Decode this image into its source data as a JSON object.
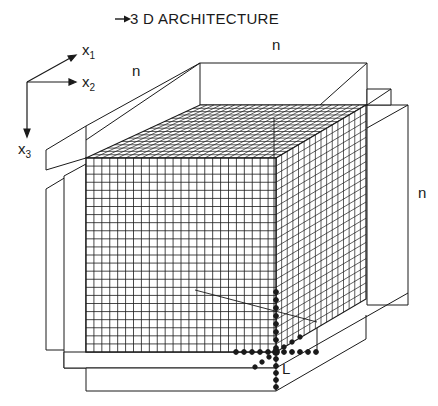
{
  "title": "3 D ARCHITECTURE",
  "title_arrow": "right-arrow",
  "axes": {
    "x1": {
      "base": "x",
      "sub": "1"
    },
    "x2": {
      "base": "x",
      "sub": "2"
    },
    "x3": {
      "base": "x",
      "sub": "3"
    }
  },
  "dimension_labels": {
    "top_left": "n",
    "top_back": "n",
    "right": "n"
  },
  "corner_label": "L",
  "grid": {
    "front_cols": 24,
    "front_rows": 24,
    "depth_cells": 16
  },
  "colors": {
    "line": "#1a1a1a",
    "background": "#ffffff"
  }
}
